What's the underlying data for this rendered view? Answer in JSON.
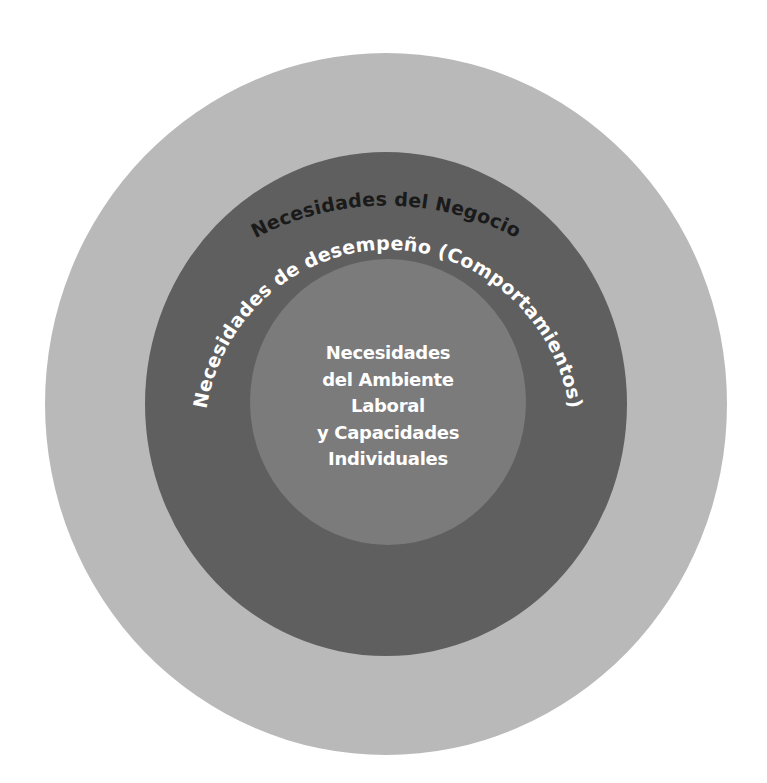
{
  "diagram": {
    "type": "concentric-circles",
    "colors": {
      "background": "#ffffff",
      "outer_ring": "#b9b9b9",
      "middle_ring": "#5f5f5f",
      "inner_circle": "#7b7b7b",
      "outer_label_color": "#1a1a1a",
      "inner_label_color": "#ffffff"
    },
    "outer": {
      "label": "Necesidades del Negocio"
    },
    "middle": {
      "label": "Necesidades de desempeño (Comportamientos)"
    },
    "inner": {
      "lines": [
        "Necesidades",
        "del Ambiente",
        "Laboral",
        "y Capacidades",
        "Individuales"
      ]
    }
  }
}
